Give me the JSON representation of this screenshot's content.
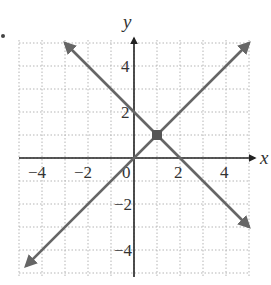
{
  "chart_data": {
    "type": "line",
    "title": "",
    "xlabel": "x",
    "ylabel": "y",
    "xlim": [
      -5,
      5
    ],
    "ylim": [
      -5,
      5
    ],
    "grid": true,
    "grid_style": "dotted",
    "x_ticks": [
      -4,
      -2,
      0,
      2,
      4
    ],
    "y_ticks": [
      -4,
      -2,
      2,
      4
    ],
    "x_tick_labels": [
      "−4",
      "−2",
      "0",
      "2",
      "4"
    ],
    "y_tick_labels": [
      "−4",
      "−2",
      "2",
      "4"
    ],
    "origin_label": "0",
    "series": [
      {
        "name": "y = x",
        "x": [
          -4.7,
          5
        ],
        "y": [
          -4.7,
          5
        ],
        "arrows": "both"
      },
      {
        "name": "y = -x + 2",
        "x": [
          -3,
          5
        ],
        "y": [
          5,
          -3
        ],
        "arrows": "both"
      }
    ],
    "points": [
      {
        "label": "intersection",
        "x": 1,
        "y": 1,
        "marker": "square"
      }
    ],
    "colors": {
      "line": "#666666",
      "axis": "#222222",
      "grid": "#b5b5b5",
      "point": "#555555"
    }
  }
}
